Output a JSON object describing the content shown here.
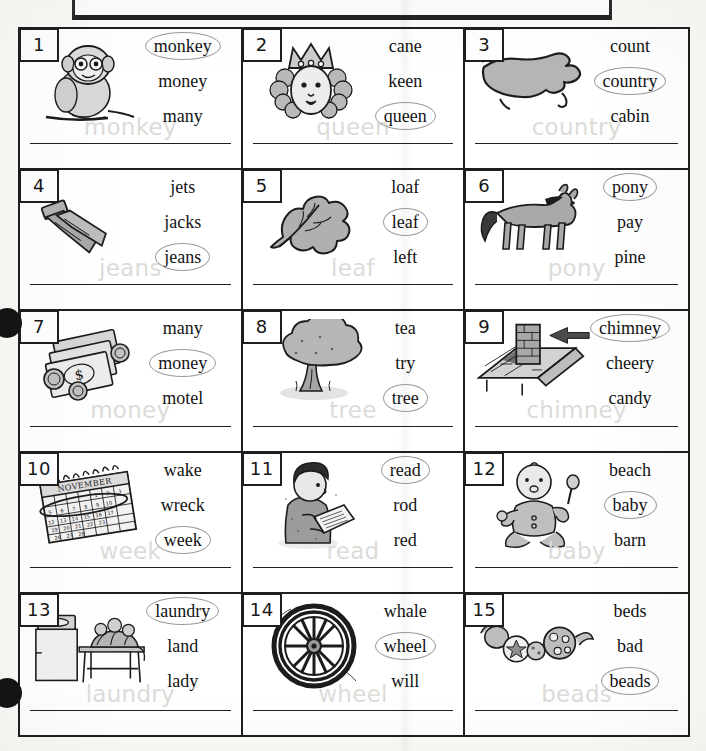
{
  "page": {
    "header_box_label": "",
    "columns": 3,
    "rows": 5,
    "hole_punch_count": 2,
    "ghost_color": "#dddbd8",
    "circle_color": "#9b9b9b",
    "ink_color": "#131313"
  },
  "items": [
    {
      "number": "1",
      "picture": "monkey-icon",
      "choices": [
        "monkey",
        "money",
        "many"
      ],
      "circled": "monkey",
      "ghost_word": "monkey"
    },
    {
      "number": "2",
      "picture": "queen-icon",
      "choices": [
        "cane",
        "keen",
        "queen"
      ],
      "circled": "queen",
      "ghost_word": "queen"
    },
    {
      "number": "3",
      "picture": "country-map-icon",
      "choices": [
        "count",
        "country",
        "cabin"
      ],
      "circled": "country",
      "ghost_word": "country"
    },
    {
      "number": "4",
      "picture": "jeans-icon",
      "choices": [
        "jets",
        "jacks",
        "jeans"
      ],
      "circled": "jeans",
      "ghost_word": "jeans"
    },
    {
      "number": "5",
      "picture": "leaf-icon",
      "choices": [
        "loaf",
        "leaf",
        "left"
      ],
      "circled": "leaf",
      "ghost_word": "leaf"
    },
    {
      "number": "6",
      "picture": "pony-icon",
      "choices": [
        "pony",
        "pay",
        "pine"
      ],
      "circled": "pony",
      "ghost_word": "pony"
    },
    {
      "number": "7",
      "picture": "money-icon",
      "choices": [
        "many",
        "money",
        "motel"
      ],
      "circled": "money",
      "ghost_word": "money"
    },
    {
      "number": "8",
      "picture": "tree-icon",
      "choices": [
        "tea",
        "try",
        "tree"
      ],
      "circled": "tree",
      "ghost_word": "tree"
    },
    {
      "number": "9",
      "picture": "chimney-icon",
      "choices": [
        "chimney",
        "cheery",
        "candy"
      ],
      "circled": "chimney",
      "ghost_word": "chimney"
    },
    {
      "number": "10",
      "picture": "calendar-icon",
      "picture_label": "NOVEMBER",
      "choices": [
        "wake",
        "wreck",
        "week"
      ],
      "circled": "week",
      "ghost_word": "week"
    },
    {
      "number": "11",
      "picture": "reading-boy-icon",
      "choices": [
        "read",
        "rod",
        "red"
      ],
      "circled": "read",
      "ghost_word": "read"
    },
    {
      "number": "12",
      "picture": "baby-icon",
      "choices": [
        "beach",
        "baby",
        "barn"
      ],
      "circled": "baby",
      "ghost_word": "baby"
    },
    {
      "number": "13",
      "picture": "laundry-icon",
      "choices": [
        "laundry",
        "land",
        "lady"
      ],
      "circled": "laundry",
      "ghost_word": "laundry"
    },
    {
      "number": "14",
      "picture": "wheel-icon",
      "choices": [
        "whale",
        "wheel",
        "will"
      ],
      "circled": "wheel",
      "ghost_word": "wheel"
    },
    {
      "number": "15",
      "picture": "beads-icon",
      "choices": [
        "beds",
        "bad",
        "beads"
      ],
      "circled": "beads",
      "ghost_word": "beads"
    }
  ]
}
